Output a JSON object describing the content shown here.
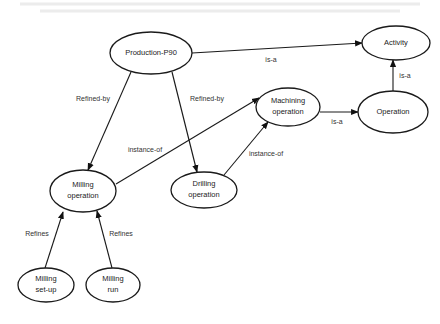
{
  "diagram": {
    "title": "",
    "nodes": [
      {
        "id": "production-p90",
        "lines": [
          "Production-P90"
        ]
      },
      {
        "id": "activity",
        "lines": [
          "Activity"
        ]
      },
      {
        "id": "operation",
        "lines": [
          "Operation"
        ]
      },
      {
        "id": "machining-operation",
        "lines": [
          "Machining",
          "operation"
        ]
      },
      {
        "id": "milling-operation",
        "lines": [
          "Milling",
          "operation"
        ]
      },
      {
        "id": "drilling-operation",
        "lines": [
          "Drilling",
          "operation"
        ]
      },
      {
        "id": "milling-set-up",
        "lines": [
          "Milling",
          "set-up"
        ]
      },
      {
        "id": "milling-run",
        "lines": [
          "Milling",
          "run"
        ]
      }
    ],
    "edges": [
      {
        "from": "production-p90",
        "to": "activity",
        "label": "is-a"
      },
      {
        "from": "operation",
        "to": "activity",
        "label": "is-a"
      },
      {
        "from": "machining-operation",
        "to": "operation",
        "label": "is-a"
      },
      {
        "from": "production-p90",
        "to": "milling-operation",
        "label": "Refined-by"
      },
      {
        "from": "production-p90",
        "to": "drilling-operation",
        "label": "Refined-by"
      },
      {
        "from": "milling-operation",
        "to": "machining-operation",
        "label": "instance-of"
      },
      {
        "from": "drilling-operation",
        "to": "machining-operation",
        "label": "instance-of"
      },
      {
        "from": "milling-set-up",
        "to": "milling-operation",
        "label": "Refines"
      },
      {
        "from": "milling-run",
        "to": "milling-operation",
        "label": "Refines"
      }
    ]
  }
}
